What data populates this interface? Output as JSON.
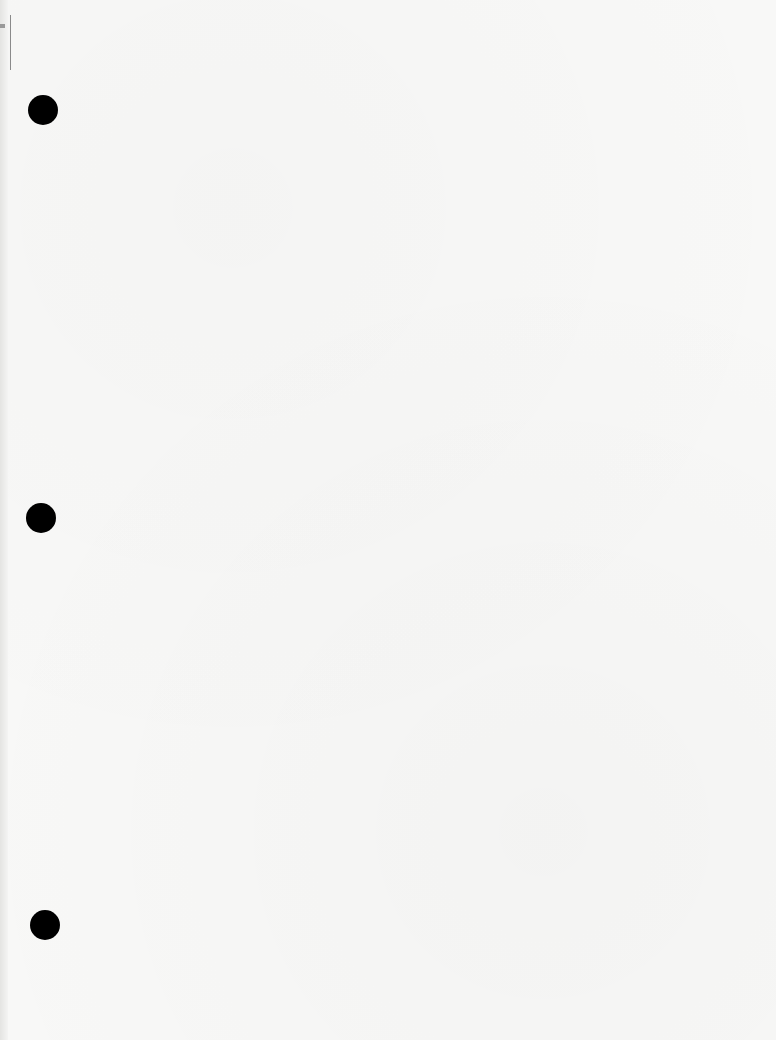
{
  "document": {
    "type": "blank scanned page",
    "text": "",
    "punch_holes": [
      {
        "x": 43,
        "y": 110
      },
      {
        "x": 41,
        "y": 518
      },
      {
        "x": 45,
        "y": 925
      }
    ],
    "colors": {
      "paper": "#f8f8f7",
      "hole": "#000000"
    }
  }
}
